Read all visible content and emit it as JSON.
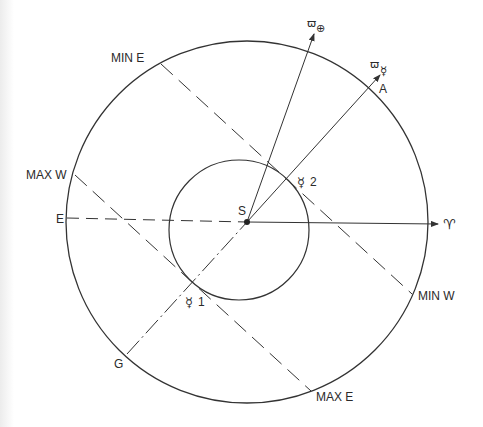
{
  "diagram": {
    "colors": {
      "stroke": "#333333",
      "text": "#2a2a2a",
      "background": "#ffffff"
    },
    "center_label": "S",
    "orbits": {
      "outer": {
        "name": "Earth orbit",
        "cx": 247,
        "cy": 222,
        "r": 181
      },
      "inner": {
        "name": "Mercury orbit",
        "cx": 239,
        "cy": 230,
        "r": 70
      }
    },
    "labels": {
      "min_e": "MIN E",
      "max_w": "MAX W",
      "e": "E",
      "g": "G",
      "a": "A",
      "min_w": "MIN W",
      "max_e": "MAX E",
      "sun": "S",
      "aries": "♈",
      "mercury_1_symbol": "☿",
      "mercury_1_index": "1",
      "mercury_2_symbol": "☿",
      "mercury_2_index": "2",
      "perihelion_earth_varpi": "ϖ",
      "perihelion_earth_symbol": "⊕",
      "perihelion_mercury_varpi": "ϖ",
      "perihelion_mercury_symbol": "☿"
    },
    "lines": [
      {
        "name": "E to S (dashed)",
        "from": [
          67,
          218
        ],
        "to": [
          247,
          222
        ],
        "style": "dashed"
      },
      {
        "name": "S to vernal equinox (solid arrow)",
        "from": [
          247,
          222
        ],
        "to": [
          440,
          224
        ],
        "style": "solid-arrow"
      },
      {
        "name": "G to S (dash-dot)",
        "from": [
          127,
          354
        ],
        "to": [
          247,
          222
        ],
        "style": "dash-dot"
      },
      {
        "name": "S to A, Mercury perihelion (solid arrow)",
        "from": [
          247,
          222
        ],
        "to": [
          375,
          80
        ],
        "style": "solid-arrow"
      },
      {
        "name": "S to Earth perihelion (solid arrow)",
        "from": [
          247,
          222
        ],
        "to": [
          312,
          38
        ],
        "style": "solid-arrow"
      },
      {
        "name": "MIN E to MIN W (dashed tangent)",
        "from": [
          161,
          64
        ],
        "to": [
          412,
          294
        ],
        "style": "long-dash"
      },
      {
        "name": "MAX W to MAX E (dashed tangent)",
        "from": [
          75,
          175
        ],
        "to": [
          311,
          391
        ],
        "style": "long-dash"
      }
    ]
  }
}
